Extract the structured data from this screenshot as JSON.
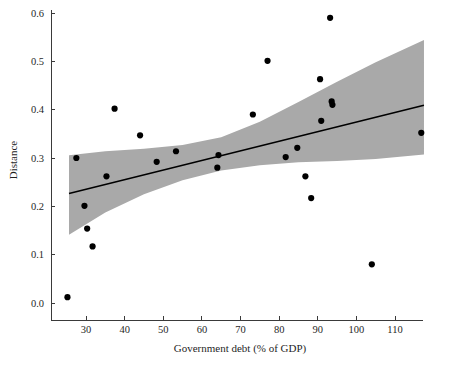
{
  "chart_data": {
    "type": "scatter",
    "title": "",
    "subtitle": "",
    "xlabel": "Government debt (% of GDP)",
    "ylabel": "Distance",
    "xlim": [
      22.5,
      119.5
    ],
    "ylim": [
      -0.02,
      0.625
    ],
    "xticks": [
      30,
      40,
      50,
      60,
      70,
      80,
      90,
      100,
      110
    ],
    "xtick_labels": [
      "30",
      "40",
      "50",
      "60",
      "70",
      "80",
      "90",
      "100",
      "110"
    ],
    "yticks": [
      0.0,
      0.1,
      0.2,
      0.3,
      0.4,
      0.5,
      0.6
    ],
    "ytick_labels": [
      "0.0",
      "0.1",
      "0.2",
      "0.3",
      "0.4",
      "0.5",
      "0.6"
    ],
    "grid": false,
    "legend": null,
    "legend_position": "none",
    "point_color": "#000000",
    "line_color": "#000000",
    "band_color": "#a9a9a9",
    "marker_size": 3.1,
    "points": [
      {
        "x": 25.2,
        "y": 0.012
      },
      {
        "x": 27.5,
        "y": 0.3
      },
      {
        "x": 29.6,
        "y": 0.201
      },
      {
        "x": 30.3,
        "y": 0.154
      },
      {
        "x": 31.7,
        "y": 0.117
      },
      {
        "x": 35.3,
        "y": 0.262
      },
      {
        "x": 37.4,
        "y": 0.402
      },
      {
        "x": 44.0,
        "y": 0.347
      },
      {
        "x": 48.3,
        "y": 0.292
      },
      {
        "x": 53.3,
        "y": 0.314
      },
      {
        "x": 64.0,
        "y": 0.28
      },
      {
        "x": 64.3,
        "y": 0.306
      },
      {
        "x": 73.2,
        "y": 0.39
      },
      {
        "x": 77.0,
        "y": 0.501
      },
      {
        "x": 81.7,
        "y": 0.302
      },
      {
        "x": 84.7,
        "y": 0.321
      },
      {
        "x": 86.8,
        "y": 0.262
      },
      {
        "x": 88.3,
        "y": 0.217
      },
      {
        "x": 90.6,
        "y": 0.463
      },
      {
        "x": 90.9,
        "y": 0.377
      },
      {
        "x": 93.2,
        "y": 0.59
      },
      {
        "x": 93.6,
        "y": 0.417
      },
      {
        "x": 93.8,
        "y": 0.41
      },
      {
        "x": 104.0,
        "y": 0.08
      },
      {
        "x": 116.8,
        "y": 0.352
      }
    ],
    "fit_line": {
      "x_start": 25.6,
      "y_start": 0.2265,
      "x_end": 117.5,
      "y_end": 0.409
    },
    "confidence_band": {
      "upper": [
        {
          "x": 25.6,
          "y": 0.3055
        },
        {
          "x": 35.0,
          "y": 0.314
        },
        {
          "x": 45.0,
          "y": 0.319
        },
        {
          "x": 55.0,
          "y": 0.327
        },
        {
          "x": 65.0,
          "y": 0.343
        },
        {
          "x": 75.0,
          "y": 0.375
        },
        {
          "x": 85.0,
          "y": 0.416
        },
        {
          "x": 95.0,
          "y": 0.458
        },
        {
          "x": 105.0,
          "y": 0.498
        },
        {
          "x": 117.5,
          "y": 0.544
        }
      ],
      "lower": [
        {
          "x": 25.6,
          "y": 0.141
        },
        {
          "x": 35.0,
          "y": 0.187
        },
        {
          "x": 45.0,
          "y": 0.225
        },
        {
          "x": 55.0,
          "y": 0.254
        },
        {
          "x": 65.0,
          "y": 0.274
        },
        {
          "x": 75.0,
          "y": 0.285
        },
        {
          "x": 85.0,
          "y": 0.291
        },
        {
          "x": 95.0,
          "y": 0.294
        },
        {
          "x": 105.0,
          "y": 0.298
        },
        {
          "x": 117.5,
          "y": 0.307
        }
      ]
    }
  }
}
